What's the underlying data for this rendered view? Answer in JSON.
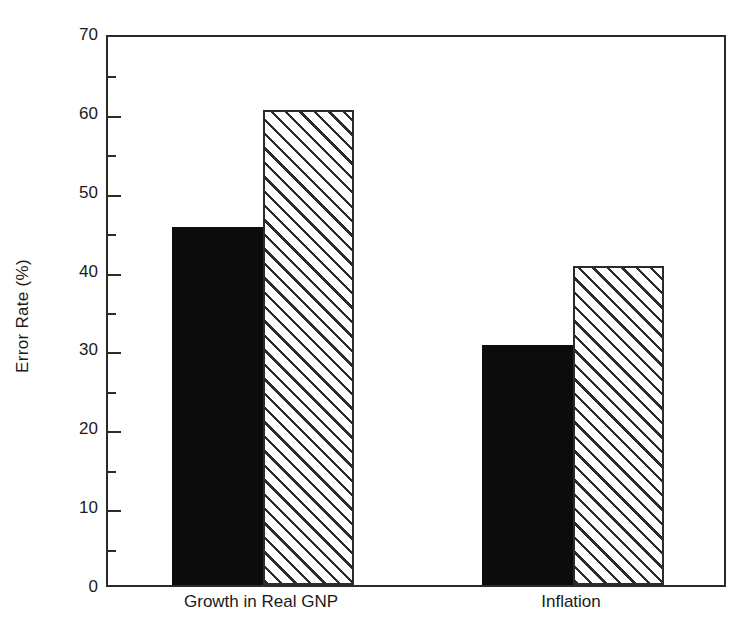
{
  "chart_data": {
    "type": "bar",
    "title": "",
    "subtitle": "",
    "xlabel": "",
    "ylabel": "Error Rate (%)",
    "categories": [
      "Growth in Real GNP",
      "Inflation"
    ],
    "series": [
      {
        "name": "series-1-solid",
        "fill": "solid-black",
        "color": "#0c0c0c",
        "values": [
          45.4,
          30.4
        ]
      },
      {
        "name": "series-2-hatched",
        "fill": "diagonal-hatch",
        "color": "#2b2b2b",
        "values": [
          60.2,
          40.4
        ]
      }
    ],
    "ylim": [
      0,
      70
    ],
    "y_major_ticks": [
      0,
      10,
      20,
      30,
      40,
      50,
      60,
      70
    ],
    "y_minor_ticks": [
      5,
      15,
      25,
      35,
      45,
      55,
      65
    ],
    "y_tick_labels": [
      "0",
      "10",
      "20",
      "30",
      "40",
      "50",
      "60",
      "70"
    ],
    "grid": false,
    "legend": false,
    "legend_position": "none",
    "bar_groups_touching": true
  },
  "axis": {
    "y_title": "Error Rate (%)",
    "tick_labels": [
      "70",
      "60",
      "50",
      "40",
      "30",
      "20",
      "10",
      "0"
    ]
  },
  "categories": {
    "label_0": "Growth in Real GNP",
    "label_1": "Inflation"
  },
  "colors": {
    "frame": "#2b2b2b",
    "solid_bar": "#0c0c0c",
    "hatch_line": "#2b2b2b",
    "background": "#ffffff",
    "text": "#1a1a1a"
  }
}
